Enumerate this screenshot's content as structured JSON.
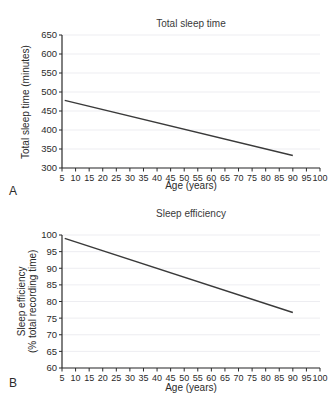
{
  "figure": {
    "background": "#ffffff",
    "line_color": "#3a3a3a",
    "grid_color": "#e9e9ee",
    "axis_color": "#2b2b2b"
  },
  "panels": [
    {
      "letter": "A",
      "title": "Total sleep time",
      "xlabel": "Age (years)",
      "ylabel": "Total sleep time (minutes)"
    },
    {
      "letter": "B",
      "title": "Sleep efficiency",
      "xlabel": "Age (years)",
      "ylabel_line1": "Sleep efficiency",
      "ylabel_line2": "(% total recording time)"
    }
  ],
  "chart_data": [
    {
      "type": "line",
      "title": "Total sleep time",
      "xlabel": "Age (years)",
      "ylabel": "Total sleep time (minutes)",
      "xlim": [
        5,
        100
      ],
      "ylim": [
        300,
        650
      ],
      "xticks": [
        5,
        10,
        15,
        20,
        25,
        30,
        35,
        40,
        45,
        50,
        55,
        60,
        65,
        70,
        75,
        80,
        85,
        90,
        95,
        100
      ],
      "yticks": [
        300,
        350,
        400,
        450,
        500,
        550,
        600,
        650
      ],
      "grid": true,
      "legend": "none",
      "series": [
        {
          "name": "Total sleep time",
          "x": [
            6,
            90
          ],
          "values": [
            478,
            333
          ]
        }
      ]
    },
    {
      "type": "line",
      "title": "Sleep efficiency",
      "xlabel": "Age (years)",
      "ylabel": "Sleep efficiency (% total recording time)",
      "xlim": [
        5,
        100
      ],
      "ylim": [
        60,
        100
      ],
      "xticks": [
        5,
        10,
        15,
        20,
        25,
        30,
        35,
        40,
        45,
        50,
        55,
        60,
        65,
        70,
        75,
        80,
        85,
        90,
        95,
        100
      ],
      "yticks": [
        60,
        65,
        70,
        75,
        80,
        85,
        90,
        95,
        100
      ],
      "grid": true,
      "legend": "none",
      "series": [
        {
          "name": "Sleep efficiency",
          "x": [
            6,
            90
          ],
          "values": [
            99,
            76.7
          ]
        }
      ]
    }
  ]
}
